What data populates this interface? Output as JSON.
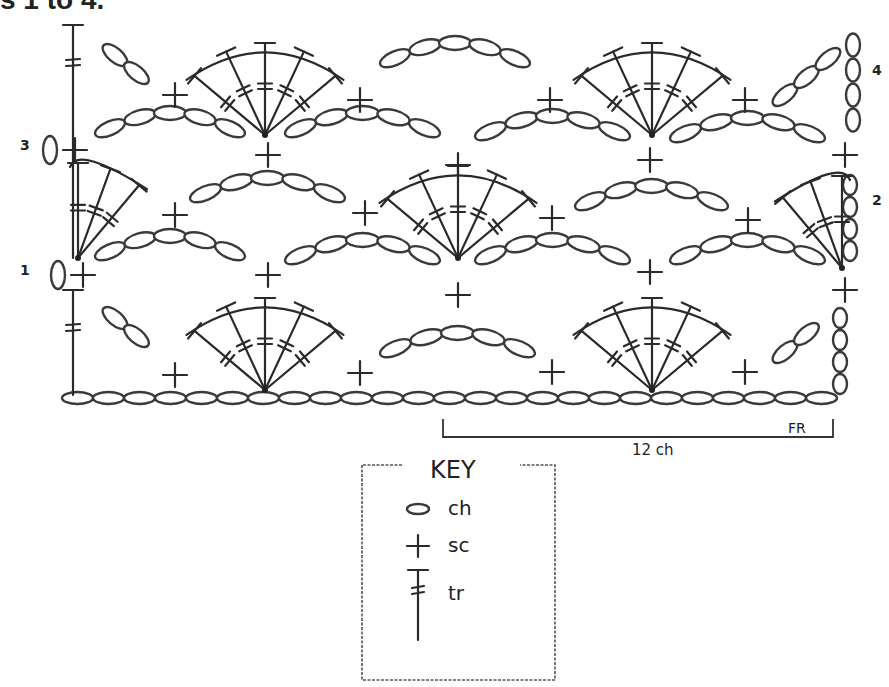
{
  "header": {
    "title_fragment": "s 1 to 4."
  },
  "row_labels": [
    {
      "label": "1",
      "x": 20,
      "y": 275
    },
    {
      "label": "2",
      "x": 872,
      "y": 205
    },
    {
      "label": "3",
      "x": 20,
      "y": 150
    },
    {
      "label": "4",
      "x": 872,
      "y": 75
    }
  ],
  "foundation": {
    "chain_count": 25,
    "x_start": 62,
    "y": 398,
    "chain_width": 31
  },
  "repeat_bracket": {
    "label": "12 ch",
    "end_label": "FR",
    "x_start": 443,
    "x_end": 833,
    "y": 437
  },
  "key": {
    "title": "KEY",
    "items": [
      {
        "symbol": "chain-oval",
        "label": "ch"
      },
      {
        "symbol": "plus",
        "label": "sc"
      },
      {
        "symbol": "treble-post",
        "label": "tr"
      }
    ]
  },
  "fans": [
    {
      "x": 265,
      "y": 135,
      "r": 92,
      "tr_count": 5
    },
    {
      "x": 652,
      "y": 135,
      "r": 92,
      "tr_count": 5
    },
    {
      "x": 458,
      "y": 258,
      "r": 92,
      "tr_count": 5
    },
    {
      "x": 265,
      "y": 390,
      "r": 92,
      "tr_count": 5
    },
    {
      "x": 652,
      "y": 390,
      "r": 92,
      "tr_count": 5
    }
  ],
  "half_fans": [
    {
      "x": 78,
      "y": 258,
      "side": "right"
    },
    {
      "x": 842,
      "y": 268,
      "side": "left"
    }
  ],
  "single_crochets": [
    [
      175,
      95
    ],
    [
      360,
      100
    ],
    [
      550,
      100
    ],
    [
      745,
      100
    ],
    [
      268,
      155
    ],
    [
      458,
      165
    ],
    [
      650,
      160
    ],
    [
      845,
      155
    ],
    [
      175,
      215
    ],
    [
      365,
      213
    ],
    [
      552,
      218
    ],
    [
      748,
      220
    ],
    [
      268,
      275
    ],
    [
      458,
      295
    ],
    [
      650,
      272
    ],
    [
      845,
      290
    ],
    [
      175,
      375
    ],
    [
      360,
      373
    ],
    [
      552,
      372
    ],
    [
      745,
      372
    ]
  ],
  "chain_arcs": [
    {
      "x1": 95,
      "y1": 135,
      "x2": 245,
      "y2": 135,
      "n": 5
    },
    {
      "x1": 285,
      "y1": 135,
      "x2": 440,
      "y2": 135,
      "n": 5
    },
    {
      "x1": 475,
      "y1": 138,
      "x2": 630,
      "y2": 138,
      "n": 5
    },
    {
      "x1": 670,
      "y1": 140,
      "x2": 825,
      "y2": 140,
      "n": 5
    },
    {
      "x1": 190,
      "y1": 200,
      "x2": 345,
      "y2": 200,
      "n": 5
    },
    {
      "x1": 575,
      "y1": 208,
      "x2": 728,
      "y2": 208,
      "n": 5
    },
    {
      "x1": 95,
      "y1": 258,
      "x2": 245,
      "y2": 258,
      "n": 5
    },
    {
      "x1": 285,
      "y1": 262,
      "x2": 440,
      "y2": 262,
      "n": 5
    },
    {
      "x1": 475,
      "y1": 262,
      "x2": 630,
      "y2": 262,
      "n": 5
    },
    {
      "x1": 670,
      "y1": 262,
      "x2": 825,
      "y2": 262,
      "n": 5
    },
    {
      "x1": 380,
      "y1": 355,
      "x2": 535,
      "y2": 355,
      "n": 5
    },
    {
      "x1": 380,
      "y1": 65,
      "x2": 530,
      "y2": 65,
      "n": 5
    }
  ],
  "diag_chains": [
    {
      "x": 115,
      "y": 55,
      "angle": 40,
      "n": 2
    },
    {
      "x": 115,
      "y": 318,
      "angle": 40,
      "n": 2
    },
    {
      "x": 785,
      "y": 95,
      "angle": -40,
      "n": 3
    },
    {
      "x": 785,
      "y": 352,
      "angle": -40,
      "n": 2
    }
  ],
  "vertical_chains": [
    {
      "x": 853,
      "y": 45,
      "n": 4,
      "gap": 25
    },
    {
      "x": 850,
      "y": 185,
      "n": 4,
      "gap": 22
    },
    {
      "x": 840,
      "y": 318,
      "n": 4,
      "gap": 22
    }
  ],
  "turning_posts": [
    {
      "x": 73,
      "y1": 25,
      "y2": 135
    },
    {
      "x": 73,
      "y1": 290,
      "y2": 395
    }
  ],
  "side_ovals": [
    {
      "x": 50,
      "y": 150
    },
    {
      "x": 58,
      "y": 275
    }
  ]
}
